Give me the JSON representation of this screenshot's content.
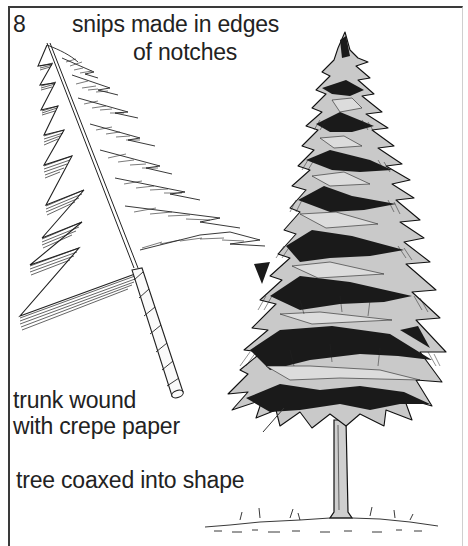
{
  "figure": {
    "step_number": "8",
    "labels": {
      "snips_line1": "snips made in edges",
      "snips_line2": "of notches",
      "trunk_line1": "trunk wound",
      "trunk_line2": "with crepe paper",
      "shape": "tree coaxed into shape"
    },
    "illustrations": [
      "paper-tree-with-notches-icon",
      "crepe-paper-wound-trunk-icon",
      "finished-fir-tree-icon"
    ],
    "colors": {
      "ink": "#222222",
      "foliage_fill": "#c9c9c9",
      "shadow": "#1a1a1a",
      "border": "#3a3a3a"
    }
  }
}
